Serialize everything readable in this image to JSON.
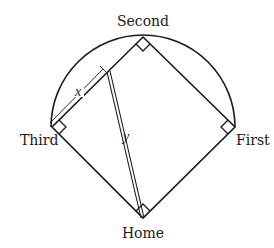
{
  "diagram": {
    "type": "baseball-diamond",
    "bases": {
      "second": {
        "label": "Second",
        "x": 143,
        "y": 37
      },
      "third": {
        "label": "Third",
        "x": 52,
        "y": 127
      },
      "first": {
        "label": "First",
        "x": 235,
        "y": 127
      },
      "home": {
        "label": "Home",
        "x": 143,
        "y": 218
      }
    },
    "arc": {
      "cx": 143,
      "cy": 127,
      "r": 92
    },
    "segments": {
      "x": {
        "label": "x"
      },
      "y": {
        "label": "y"
      }
    },
    "right_angle_markers": [
      "second",
      "third",
      "first",
      "home"
    ],
    "colors": {
      "stroke": "#1a1a1a",
      "background": "#ffffff"
    }
  }
}
